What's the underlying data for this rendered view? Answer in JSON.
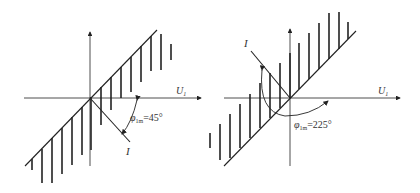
{
  "diagrams": [
    {
      "id": "left",
      "axis_label": "U",
      "axis_label_sub": "1",
      "current_label": "I",
      "angle_symbol": "φ",
      "angle_sub": "1m",
      "angle_value": "=45°"
    },
    {
      "id": "right",
      "axis_label": "U",
      "axis_label_sub": "1",
      "current_label": "I",
      "angle_symbol": "φ",
      "angle_sub": "1m",
      "angle_value": "=225°"
    }
  ],
  "colors": {
    "line": "#222222",
    "text": "#333333"
  }
}
